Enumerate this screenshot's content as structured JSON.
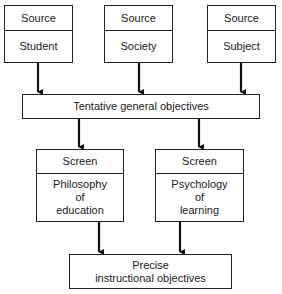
{
  "sources": [
    {
      "header": "Source",
      "label": "Student"
    },
    {
      "header": "Source",
      "label": "Society"
    },
    {
      "header": "Source",
      "label": "Subject"
    }
  ],
  "tentative": {
    "label": "Tentative general objectives"
  },
  "screens": [
    {
      "header": "Screen",
      "label": "Philosophy\nof\neducation"
    },
    {
      "header": "Screen",
      "label": "Psychology\nof\nlearning"
    }
  ],
  "final": {
    "label": "Precise\ninstructional objectives"
  },
  "colors": {
    "line": "#222222",
    "background": "#ffffff"
  }
}
